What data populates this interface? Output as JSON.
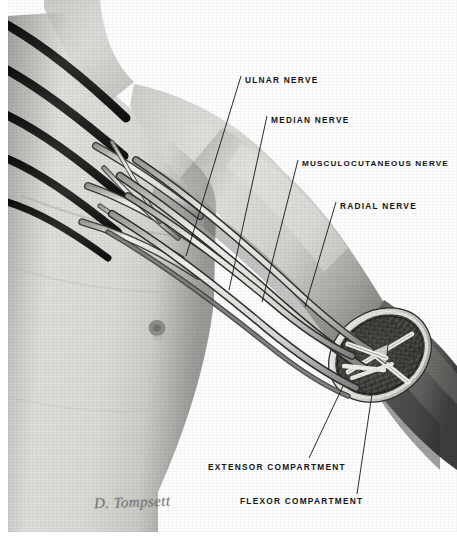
{
  "plate": {
    "title": "Nerves of the right upper limb with cross-section of the arm",
    "medium": "pencil and wash anatomical illustration",
    "background_color": "#ffffff",
    "ink_color": "#141414",
    "skin_tone": "#d8d7d4",
    "shadow_tone": "#6e6d6b",
    "dark_tone": "#4a4a49",
    "width": 457,
    "height": 540
  },
  "signature": {
    "text": "D. Tompsett",
    "color": "#6d6d6d"
  },
  "labels": [
    {
      "id": "ulnar-nerve",
      "text": "ULNAR NERVE",
      "x": 245,
      "y": 78,
      "leader_from": [
        241,
        84
      ],
      "leader_to": [
        186,
        256
      ]
    },
    {
      "id": "median-nerve",
      "text": "MEDIAN NERVE",
      "x": 271,
      "y": 118,
      "leader_from": [
        267,
        124
      ],
      "leader_to": [
        229,
        290
      ]
    },
    {
      "id": "musculocutaneous-nerve",
      "text": "MUSCULOCUTANEOUS NERVE",
      "x": 302,
      "y": 162,
      "leader_from": [
        298,
        168
      ],
      "leader_to": [
        262,
        300
      ]
    },
    {
      "id": "radial-nerve",
      "text": "RADIAL NERVE",
      "x": 340,
      "y": 204,
      "leader_from": [
        336,
        210
      ],
      "leader_to": [
        305,
        306
      ]
    },
    {
      "id": "extensor-compartment",
      "text": "EXTENSOR  COMPARTMENT",
      "x": 208,
      "y": 464,
      "leader_from": [
        309,
        462
      ],
      "leader_to": [
        343,
        388
      ]
    },
    {
      "id": "flexor-compartment",
      "text": "FLEXOR  COMPARTMENT",
      "x": 240,
      "y": 498,
      "leader_from": [
        357,
        496
      ],
      "leader_to": [
        372,
        398
      ]
    }
  ],
  "anatomy": {
    "regions": [
      {
        "name": "neck-and-shoulder",
        "tone": "#d9d8d5"
      },
      {
        "name": "chest-pectoral",
        "tone": "#dcdbd8"
      },
      {
        "name": "upper-arm",
        "tone": "#cfcecb"
      },
      {
        "name": "forearm-distal",
        "tone": "#6b6a68"
      },
      {
        "name": "cross-section-face",
        "tone": "#3a3a38"
      }
    ],
    "nerves": [
      {
        "name": "brachial-plexus-root-1",
        "shade": "#1f1f1e"
      },
      {
        "name": "brachial-plexus-root-2",
        "shade": "#232322"
      },
      {
        "name": "brachial-plexus-root-3",
        "shade": "#262625"
      },
      {
        "name": "brachial-plexus-root-4",
        "shade": "#2a2a29"
      },
      {
        "name": "ulnar-nerve-trunk",
        "shade": "#e7e6e3"
      },
      {
        "name": "median-nerve-trunk",
        "shade": "#e9e8e5"
      },
      {
        "name": "musculocutaneous-nerve-trunk",
        "shade": "#e5e4e1"
      },
      {
        "name": "radial-nerve-trunk",
        "shade": "#e3e2df"
      }
    ],
    "landmarks": [
      {
        "name": "nipple",
        "x": 157,
        "y": 328,
        "r": 8,
        "tone": "#8f8e8c"
      },
      {
        "name": "intermuscular-septum",
        "tone": "#efeeea"
      }
    ]
  }
}
